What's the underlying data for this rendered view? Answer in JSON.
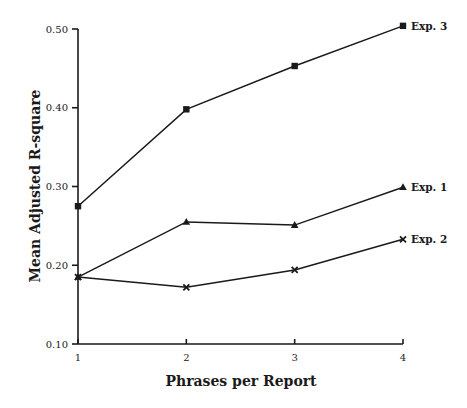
{
  "chart_data": {
    "type": "line",
    "title": "",
    "xlabel": "Phrases per Report",
    "ylabel": "Mean Adjusted R-square",
    "x": [
      1,
      2,
      3,
      4
    ],
    "x_tick_labels": [
      "1",
      "2",
      "3",
      "4"
    ],
    "y_tick_labels": [
      "0.10",
      "0.20",
      "0.30",
      "0.40",
      "0.50"
    ],
    "ylim": [
      0.1,
      0.5
    ],
    "xlim": [
      1,
      4
    ],
    "grid": false,
    "legend_position": "inline-right-end",
    "series": [
      {
        "name": "Exp. 3",
        "marker": "square",
        "values": [
          0.275,
          0.398,
          0.453,
          0.504
        ]
      },
      {
        "name": "Exp. 1",
        "marker": "triangle",
        "values": [
          0.185,
          0.255,
          0.251,
          0.299
        ]
      },
      {
        "name": "Exp. 2",
        "marker": "x",
        "values": [
          0.185,
          0.172,
          0.194,
          0.233
        ]
      }
    ]
  },
  "colors": {
    "ink": "#1a1a1a",
    "background": "#ffffff"
  }
}
